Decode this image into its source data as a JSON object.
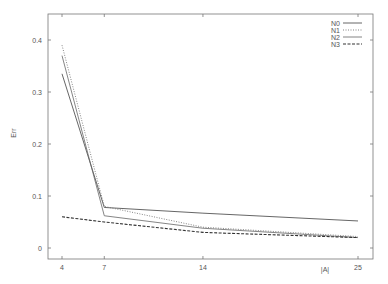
{
  "chart_data": {
    "type": "line",
    "title": "",
    "xlabel": "|A|",
    "ylabel": "Err",
    "x": [
      4,
      7,
      14,
      25
    ],
    "xticks": [
      "4",
      "7",
      "14",
      "25"
    ],
    "yticks": [
      "0",
      "0.1",
      "0.2",
      "0.3",
      "0.4"
    ],
    "ylim": [
      -0.02,
      0.45
    ],
    "xlim": [
      3.1,
      25.9
    ],
    "grid": false,
    "legend_position": "top-right",
    "series": [
      {
        "name": "N0",
        "values": [
          0.335,
          0.078,
          0.067,
          0.052
        ],
        "style": "solid",
        "color": "#555555"
      },
      {
        "name": "N1",
        "values": [
          0.39,
          0.08,
          0.04,
          0.022
        ],
        "style": "dotted",
        "color": "#777777"
      },
      {
        "name": "N2",
        "values": [
          0.37,
          0.062,
          0.038,
          0.02
        ],
        "style": "solid-thin",
        "color": "#666666"
      },
      {
        "name": "N3",
        "values": [
          0.06,
          0.05,
          0.03,
          0.02
        ],
        "style": "dashed",
        "color": "#333333"
      }
    ]
  }
}
